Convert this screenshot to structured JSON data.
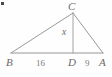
{
  "figure": {
    "type": "geometry-diagram",
    "shape": "triangle-with-altitude",
    "background_color": "#fefefe",
    "line_color": "#8d8d8d",
    "text_color": "#6f6f6f",
    "vertices": [
      {
        "id": "C",
        "label": "C",
        "x": 73,
        "y": 13,
        "role": "apex"
      },
      {
        "id": "B",
        "label": "B",
        "x": 11,
        "y": 53,
        "role": "base-left"
      },
      {
        "id": "A",
        "label": "A",
        "x": 103,
        "y": 53,
        "role": "base-right"
      },
      {
        "id": "D",
        "label": "D",
        "x": 73,
        "y": 53,
        "role": "altitude-foot"
      }
    ],
    "segments": [
      {
        "id": "BC",
        "from": "B",
        "to": "C",
        "label": ""
      },
      {
        "id": "CA",
        "from": "C",
        "to": "A",
        "label": ""
      },
      {
        "id": "BA",
        "from": "B",
        "to": "A",
        "label": ""
      },
      {
        "id": "CD",
        "from": "C",
        "to": "D",
        "label": "x",
        "kind": "altitude"
      }
    ],
    "measurements": [
      {
        "id": "BD",
        "label": "16",
        "value": 16,
        "between": [
          "B",
          "D"
        ]
      },
      {
        "id": "DA",
        "label": "9",
        "value": 9,
        "between": [
          "D",
          "A"
        ]
      },
      {
        "id": "CD",
        "label": "x",
        "value": null,
        "between": [
          "C",
          "D"
        ]
      }
    ],
    "labels": {
      "apex": "C",
      "base_left": "B",
      "base_right": "A",
      "altitude_foot": "D",
      "left_segment": "16",
      "right_segment": "9",
      "altitude": "x"
    },
    "corner_mark": {
      "present": true,
      "color": "#4a4a4a"
    }
  }
}
